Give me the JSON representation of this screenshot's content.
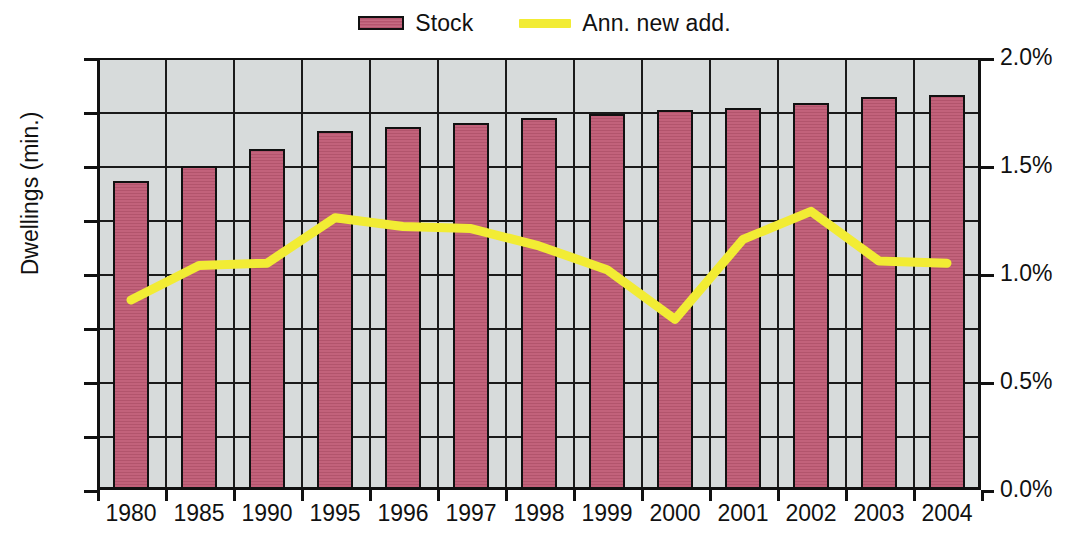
{
  "legend": {
    "position": "top-center",
    "entries": [
      {
        "label": "Stock",
        "marker": "bar-swatch",
        "color": "#bf5a74"
      },
      {
        "label": "Ann. new add.",
        "marker": "line-swatch",
        "color": "#f2ec34"
      }
    ]
  },
  "colors": {
    "bar": "#bf5a74",
    "bar_outline": "#111111",
    "line": "#f2ec34",
    "plot_background": "#d7dbdb",
    "gridline": "#1a1a1a",
    "page_background": "#ffffff",
    "text": "#111111"
  },
  "axes": {
    "left": {
      "title": "Dwellings (min.)",
      "ticks": [
        "0",
        "25",
        "50",
        "75",
        "100",
        "125",
        "150",
        "175",
        "200"
      ],
      "min": 0,
      "max": 200,
      "step": 25
    },
    "right": {
      "title": "",
      "ticks": [
        "0.0%",
        "0.5%",
        "1.0%",
        "1.5%",
        "2.0%"
      ],
      "min": 0,
      "max": 2.0,
      "step": 0.5,
      "minor_step": 0.25
    },
    "x": {
      "title": "",
      "ticks": [
        "1980",
        "1985",
        "1990",
        "1995",
        "1996",
        "1997",
        "1998",
        "1999",
        "2000",
        "2001",
        "2002",
        "2003",
        "2004"
      ]
    }
  },
  "chart_data": {
    "type": "bar",
    "title": "",
    "xlabel": "",
    "ylabel": "Dwellings (min.)",
    "ylabel_secondary": "",
    "grid": true,
    "legend_position": "top-center",
    "categories": [
      "1980",
      "1985",
      "1990",
      "1995",
      "1996",
      "1997",
      "1998",
      "1999",
      "2000",
      "2001",
      "2002",
      "2003",
      "2004"
    ],
    "ylim": [
      0,
      200
    ],
    "ylim_secondary": [
      0,
      2.0
    ],
    "series": [
      {
        "name": "Stock",
        "type": "bar",
        "axis": "left",
        "unit": "million dwellings",
        "color": "#bf5a74",
        "values": [
          143,
          150,
          158,
          166,
          168,
          170,
          172,
          174,
          176,
          177,
          179,
          182,
          183
        ]
      },
      {
        "name": "Ann. new add.",
        "type": "line",
        "axis": "right",
        "unit": "percent",
        "color": "#f2ec34",
        "values": [
          0.88,
          1.04,
          1.05,
          1.26,
          1.22,
          1.21,
          1.13,
          1.02,
          0.79,
          1.16,
          1.29,
          1.06,
          1.05
        ]
      }
    ]
  }
}
